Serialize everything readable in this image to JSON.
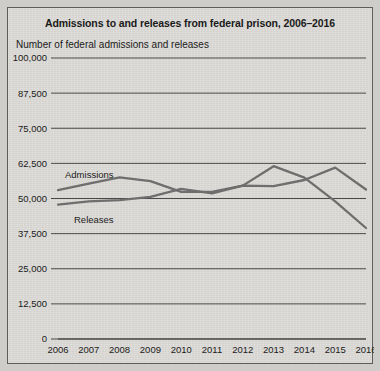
{
  "figure": {
    "title": "Admissions to and releases from federal prison, 2006–2016",
    "y_axis_title": "Number of federal admissions and releases",
    "background_color": "#dedcd8",
    "line_color": "#6e6e6e"
  },
  "chart_data": {
    "type": "line",
    "title": "Admissions to and releases from federal prison, 2006–2016",
    "subtitle": "Number of federal admissions and releases",
    "xlabel": "",
    "ylabel": "Number of federal admissions and releases",
    "categories": [
      "2006",
      "2007",
      "2008",
      "2009",
      "2010",
      "2011",
      "2012",
      "2013",
      "2014",
      "2015",
      "2016"
    ],
    "x": [
      2006,
      2007,
      2008,
      2009,
      2010,
      2011,
      2012,
      2013,
      2014,
      2015,
      2016
    ],
    "ylim": [
      0,
      100000
    ],
    "ytick_values": [
      0,
      12500,
      25000,
      37500,
      50000,
      62500,
      75000,
      87500,
      100000
    ],
    "ytick_labels": [
      "0",
      "12,500",
      "25,000",
      "37,500",
      "50,000",
      "62,500",
      "75,000",
      "87,500",
      "100,000"
    ],
    "grid": "horizontal",
    "legend": "inline-annotations",
    "annotations": [
      {
        "text": "Admissions",
        "series": "Admissions",
        "near_x": 2006
      },
      {
        "text": "Releases",
        "series": "Releases",
        "near_x": 2007
      }
    ],
    "series": [
      {
        "name": "Admissions",
        "color": "#6e6e6e",
        "values": [
          53000,
          55300,
          57500,
          56200,
          52400,
          52400,
          54600,
          54400,
          56600,
          61000,
          53200
        ]
      },
      {
        "name": "Releases",
        "color": "#6e6e6e",
        "values": [
          47800,
          49000,
          49400,
          50600,
          53400,
          51800,
          54600,
          61500,
          57400,
          49000,
          39500
        ]
      }
    ]
  }
}
